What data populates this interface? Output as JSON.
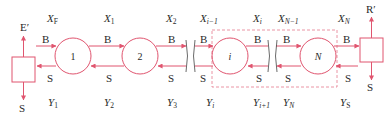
{
  "diagram": {
    "type": "countercurrent multistage cascade",
    "colors": {
      "line": "#e0556f",
      "text": "#2a2a2a",
      "dashed_box": "#e57a8e"
    },
    "left_unit": {
      "top_label": "E′",
      "bottom_label": "S"
    },
    "right_unit": {
      "top_label": "R′",
      "bottom_label": "S"
    },
    "stages": [
      {
        "label": "1",
        "italic": false
      },
      {
        "label": "2",
        "italic": false
      },
      {
        "label": "i",
        "italic": true
      },
      {
        "label": "N",
        "italic": true
      }
    ],
    "stream_labels": {
      "B": "B",
      "S": "S"
    },
    "top_labels": [
      {
        "base": "X",
        "sub": "F",
        "sub_italic": false
      },
      {
        "base": "X",
        "sub": "1",
        "sub_italic": false
      },
      {
        "base": "X",
        "sub": "2",
        "sub_italic": false
      },
      {
        "base": "X",
        "sub": "i−1",
        "sub_italic": true
      },
      {
        "base": "X",
        "sub": "i",
        "sub_italic": true
      },
      {
        "base": "X",
        "sub": "N−1",
        "sub_italic": true
      },
      {
        "base": "X",
        "sub": "N",
        "sub_italic": true
      }
    ],
    "bottom_labels": [
      {
        "base": "Y",
        "sub": "1",
        "sub_italic": false
      },
      {
        "base": "Y",
        "sub": "2",
        "sub_italic": false
      },
      {
        "base": "Y",
        "sub": "3",
        "sub_italic": false
      },
      {
        "base": "Y",
        "sub": "i",
        "sub_italic": true
      },
      {
        "base": "Y",
        "sub": "i+1",
        "sub_italic": true
      },
      {
        "base": "Y",
        "sub": "N",
        "sub_italic": true
      },
      {
        "base": "Y",
        "sub": "S",
        "sub_italic": false
      }
    ]
  }
}
